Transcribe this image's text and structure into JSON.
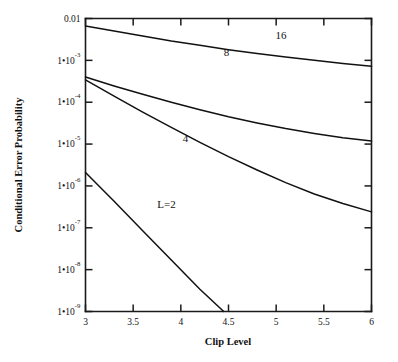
{
  "chart_data": {
    "type": "line",
    "title": "",
    "xlabel": "Clip Level",
    "ylabel": "Conditional Error Probability",
    "xlim": [
      3,
      6
    ],
    "ylim": [
      1e-09,
      0.01
    ],
    "yscale": "log",
    "xscale": "linear",
    "grid": false,
    "legend": "inline-curve-labels",
    "xticks": [
      3,
      3.5,
      4,
      4.5,
      5,
      5.5,
      6
    ],
    "xtick_labels": [
      "3",
      "3.5",
      "4",
      "4.5",
      "5",
      "5.5",
      "6"
    ],
    "yticks": [
      0.01,
      0.001,
      0.0001,
      1e-05,
      1e-06,
      1e-07,
      1e-08,
      1e-09
    ],
    "ytick_labels": [
      {
        "mantissa": "0.01",
        "base": "",
        "exponent": ""
      },
      {
        "mantissa": "1",
        "base": "10",
        "exponent": "-3"
      },
      {
        "mantissa": "1",
        "base": "10",
        "exponent": "-4"
      },
      {
        "mantissa": "1",
        "base": "10",
        "exponent": "-5"
      },
      {
        "mantissa": "1",
        "base": "10",
        "exponent": "-6"
      },
      {
        "mantissa": "1",
        "base": "10",
        "exponent": "-7"
      },
      {
        "mantissa": "1",
        "base": "10",
        "exponent": "-8"
      },
      {
        "mantissa": "1",
        "base": "10",
        "exponent": "-9"
      }
    ],
    "series": [
      {
        "name": "16",
        "label": "16",
        "label_x": 5.05,
        "label_y": 0.0033,
        "x": [
          3.0,
          3.3,
          3.6,
          3.9,
          4.2,
          4.5,
          4.8,
          5.1,
          5.4,
          5.7,
          6.0
        ],
        "y": [
          0.0066,
          0.005,
          0.0038,
          0.0029,
          0.0023,
          0.0018,
          0.00145,
          0.0012,
          0.001,
          0.00084,
          0.00072
        ]
      },
      {
        "name": "8",
        "label": "8",
        "label_x": 4.48,
        "label_y": 0.00125,
        "x": [
          3.0,
          3.3,
          3.6,
          3.9,
          4.2,
          4.5,
          4.8,
          5.1,
          5.4,
          5.7,
          6.0
        ],
        "y": [
          0.0004,
          0.000245,
          0.000155,
          0.0001,
          6.6e-05,
          4.5e-05,
          3.2e-05,
          2.35e-05,
          1.8e-05,
          1.42e-05,
          1.18e-05
        ]
      },
      {
        "name": "4",
        "label": "4",
        "label_x": 4.05,
        "label_y": 1.1e-05,
        "x": [
          3.0,
          3.3,
          3.6,
          3.9,
          4.2,
          4.5,
          4.8,
          5.1,
          5.4,
          5.7,
          6.0
        ],
        "y": [
          0.00034,
          0.00014,
          5.8e-05,
          2.5e-05,
          1.1e-05,
          5e-06,
          2.4e-06,
          1.2e-06,
          6.4e-07,
          3.8e-07,
          2.4e-07
        ]
      },
      {
        "name": "L=2",
        "label": "L=2",
        "label_x": 3.85,
        "label_y": 3e-07,
        "x": [
          3.0,
          3.3,
          3.6,
          3.9,
          4.2,
          4.45
        ],
        "y": [
          2.1e-06,
          4.3e-07,
          8.5e-08,
          1.7e-08,
          3.4e-09,
          1e-09
        ]
      }
    ]
  },
  "figure": {
    "background": "#ffffff",
    "line_color": "#111111",
    "axis_color": "#1a1a1a"
  }
}
